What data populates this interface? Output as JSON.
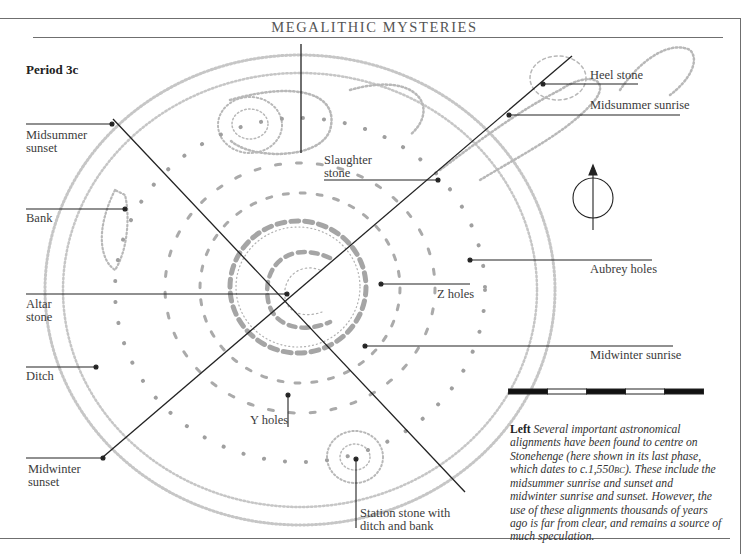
{
  "header": {
    "title": "MEGALITHIC MYSTERIES"
  },
  "figure": {
    "period_label": "Period 3c",
    "labels": {
      "midsummer_sunset": "Midsummer\nsunset",
      "bank": "Bank",
      "altar_stone": "Altar\nstone",
      "ditch": "Ditch",
      "midwinter_sunset": "Midwinter\nsunset",
      "slaughter_stone": "Slaughter\nstone",
      "heel_stone": "Heel stone",
      "midsummer_sunrise": "Midsummer sunrise",
      "aubrey_holes": "Aubrey holes",
      "z_holes": "Z holes",
      "midwinter_sunrise": "Midwinter sunrise",
      "y_holes": "Y holes",
      "station_stone": "Station stone with\nditch and bank"
    },
    "north_arrow_icon": "north-arrow-icon",
    "scale_bar": {
      "segments": 5
    },
    "colors": {
      "ink": "#222222",
      "diagram_gray": "#b5b5b5",
      "rule": "#6f6f6f"
    }
  },
  "caption": {
    "lead": "Left",
    "body_1": " Several important astronomical alignments have been found to centre on Stonehenge (here shown in its last phase, which dates to c.1,550",
    "era": "BC",
    "body_2": "). These include the midsummer sunrise and sunset and midwinter sunrise and sunset. However, the use of these alignments thousands of years ago is far from clear, and remains a source of much speculation."
  }
}
